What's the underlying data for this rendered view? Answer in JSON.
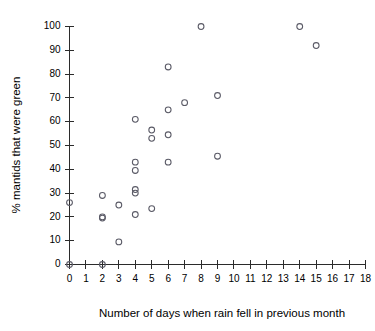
{
  "chart_data": {
    "type": "scatter",
    "title": "",
    "xlabel": "Number of days when rain fell in previous month",
    "ylabel": "% mantids that were green",
    "xlim": [
      0,
      18
    ],
    "ylim": [
      0,
      100
    ],
    "xticks": [
      0,
      1,
      2,
      3,
      4,
      5,
      6,
      7,
      8,
      9,
      10,
      11,
      12,
      13,
      14,
      15,
      16,
      17,
      18
    ],
    "xtick_labels": [
      "0",
      "1",
      "2",
      "3",
      "4",
      "5",
      "6",
      "7",
      "8",
      "9",
      "10",
      "11",
      "12",
      "13",
      "14",
      "15",
      "16",
      "17",
      "18"
    ],
    "yticks": [
      0,
      10,
      20,
      30,
      40,
      50,
      60,
      70,
      80,
      90,
      100
    ],
    "ytick_labels": [
      "0",
      "10",
      "20",
      "30",
      "40",
      "50",
      "60",
      "70",
      "80",
      "90",
      "100"
    ],
    "grid": false,
    "legend": false,
    "marker_style": "open-circle",
    "marker_color": "#5a5a66",
    "axis_color": "#2b2b2b",
    "points": [
      {
        "x": 0,
        "y": 0
      },
      {
        "x": 0,
        "y": 26
      },
      {
        "x": 2,
        "y": 0
      },
      {
        "x": 2,
        "y": 29
      },
      {
        "x": 2,
        "y": 20
      },
      {
        "x": 2,
        "y": 19.5
      },
      {
        "x": 3,
        "y": 25
      },
      {
        "x": 3,
        "y": 9.5
      },
      {
        "x": 4,
        "y": 61
      },
      {
        "x": 4,
        "y": 43
      },
      {
        "x": 4,
        "y": 39.5
      },
      {
        "x": 4,
        "y": 31.5
      },
      {
        "x": 4,
        "y": 30
      },
      {
        "x": 4,
        "y": 21
      },
      {
        "x": 5,
        "y": 56.5
      },
      {
        "x": 5,
        "y": 53
      },
      {
        "x": 5,
        "y": 23.5
      },
      {
        "x": 6,
        "y": 83
      },
      {
        "x": 6,
        "y": 65
      },
      {
        "x": 6,
        "y": 54.5
      },
      {
        "x": 6,
        "y": 43
      },
      {
        "x": 7,
        "y": 68
      },
      {
        "x": 8,
        "y": 100
      },
      {
        "x": 9,
        "y": 71
      },
      {
        "x": 9,
        "y": 45.5
      },
      {
        "x": 14,
        "y": 100
      },
      {
        "x": 15,
        "y": 92
      }
    ]
  }
}
